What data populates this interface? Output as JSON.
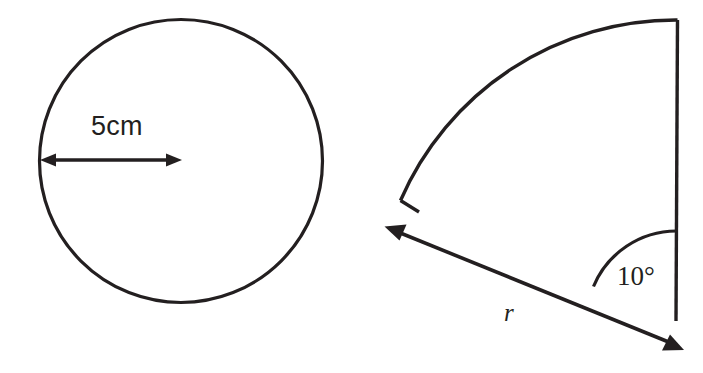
{
  "figure": {
    "background_color": "#ffffff",
    "stroke_color": "#231f20",
    "width": 703,
    "height": 373
  },
  "left_figure": {
    "name": "circle-with-radius-measure",
    "shape": "circle",
    "center": {
      "x": 181,
      "y": 161
    },
    "radius": 142,
    "stroke_width": 3,
    "measure": {
      "label": "5cm",
      "kind": "double-headed-arrow",
      "from": {
        "x": 42,
        "y": 160
      },
      "to": {
        "x": 181,
        "y": 160
      },
      "label_position": {
        "x": 91,
        "y": 113
      }
    }
  },
  "right_figure": {
    "name": "circular-sector-with-angle",
    "shape": "sector",
    "vertex": {
      "x": 676,
      "y": 320
    },
    "radius": 300,
    "stroke_width": 3,
    "arc_start": {
      "x": 678,
      "y": 20
    },
    "arc_end": {
      "x": 400,
      "y": 200
    },
    "angle_label": "10°",
    "angle_value": 10,
    "angle_unit": "degrees",
    "angle_arc_radius": 90,
    "radius_label": "r",
    "radius_arrow": {
      "kind": "double-headed-arrow",
      "tail_tip": {
        "x": 385,
        "y": 227
      },
      "head_tip": {
        "x": 683,
        "y": 350
      }
    }
  }
}
